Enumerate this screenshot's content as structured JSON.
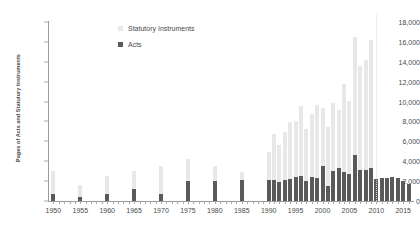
{
  "chart_data": {
    "type": "bar",
    "stacked": true,
    "title": "",
    "xlabel": "",
    "ylabel": "Pages of Acts and Statutory Instruments",
    "ylim": [
      0,
      18000
    ],
    "ytick_step": 2000,
    "ytick_labels": [
      "0",
      "2,000",
      "4,000",
      "6,000",
      "8,000",
      "10,000",
      "12,000",
      "14,000",
      "16,000",
      "18,000"
    ],
    "ytick_values": [
      0,
      2000,
      4000,
      6000,
      8000,
      10000,
      12000,
      14000,
      16000,
      18000
    ],
    "xlim": [
      1949,
      2017
    ],
    "xtick_labels": [
      "1950",
      "1955",
      "1960",
      "1965",
      "1970",
      "1975",
      "1980",
      "1985",
      "1990",
      "1995",
      "2000",
      "2005",
      "2010",
      "2015"
    ],
    "xtick_values": [
      1950,
      1955,
      1960,
      1965,
      1970,
      1975,
      1980,
      1985,
      1990,
      1995,
      2000,
      2005,
      2010,
      2015
    ],
    "grid": false,
    "legend_position": "top-center",
    "legend": [
      {
        "name": "Statutory Instruments",
        "color": "#e8e8e8"
      },
      {
        "name": "Acts",
        "color": "#5a5a5a"
      }
    ],
    "series": [
      {
        "name": "Acts",
        "color": "#5a5a5a"
      },
      {
        "name": "Statutory Instruments",
        "color": "#e8e8e8"
      }
    ],
    "annotations": [
      {
        "type": "vline",
        "x": 2010,
        "style": "dotted",
        "color": "#d8d8d8"
      }
    ],
    "points": [
      {
        "year": 1950,
        "acts": 700,
        "statutory_instruments": 3000
      },
      {
        "year": 1955,
        "acts": 450,
        "statutory_instruments": 1650
      },
      {
        "year": 1960,
        "acts": 750,
        "statutory_instruments": 2500
      },
      {
        "year": 1965,
        "acts": 1250,
        "statutory_instruments": 3000
      },
      {
        "year": 1970,
        "acts": 750,
        "statutory_instruments": 3500
      },
      {
        "year": 1975,
        "acts": 2000,
        "statutory_instruments": 4200
      },
      {
        "year": 1980,
        "acts": 2050,
        "statutory_instruments": 3500
      },
      {
        "year": 1985,
        "acts": 2100,
        "statutory_instruments": 2900
      },
      {
        "year": 1990,
        "acts": 2100,
        "statutory_instruments": 4900
      },
      {
        "year": 1991,
        "acts": 2150,
        "statutory_instruments": 6700
      },
      {
        "year": 1992,
        "acts": 1900,
        "statutory_instruments": 5600
      },
      {
        "year": 1993,
        "acts": 2150,
        "statutory_instruments": 6900
      },
      {
        "year": 1994,
        "acts": 2200,
        "statutory_instruments": 7900
      },
      {
        "year": 1995,
        "acts": 2400,
        "statutory_instruments": 8000
      },
      {
        "year": 1996,
        "acts": 2500,
        "statutory_instruments": 9600
      },
      {
        "year": 1997,
        "acts": 2000,
        "statutory_instruments": 7200
      },
      {
        "year": 1998,
        "acts": 2450,
        "statutory_instruments": 8700
      },
      {
        "year": 1999,
        "acts": 2350,
        "statutory_instruments": 9700
      },
      {
        "year": 2000,
        "acts": 3500,
        "statutory_instruments": 9400
      },
      {
        "year": 2001,
        "acts": 1550,
        "statutory_instruments": 7400
      },
      {
        "year": 2002,
        "acts": 3000,
        "statutory_instruments": 9900
      },
      {
        "year": 2003,
        "acts": 3350,
        "statutory_instruments": 9200
      },
      {
        "year": 2004,
        "acts": 2900,
        "statutory_instruments": 11800
      },
      {
        "year": 2005,
        "acts": 2700,
        "statutory_instruments": 10100
      },
      {
        "year": 2006,
        "acts": 4600,
        "statutory_instruments": 16500
      },
      {
        "year": 2007,
        "acts": 3100,
        "statutory_instruments": 13600
      },
      {
        "year": 2008,
        "acts": 3150,
        "statutory_instruments": 14200
      },
      {
        "year": 2009,
        "acts": 3300,
        "statutory_instruments": 16200
      },
      {
        "year": 2010,
        "acts": 2250,
        "statutory_instruments": 2250
      },
      {
        "year": 2011,
        "acts": 2300,
        "statutory_instruments": 2300
      },
      {
        "year": 2012,
        "acts": 2300,
        "statutory_instruments": 2300
      },
      {
        "year": 2013,
        "acts": 2450,
        "statutory_instruments": 2450
      },
      {
        "year": 2014,
        "acts": 2300,
        "statutory_instruments": 2300
      },
      {
        "year": 2015,
        "acts": 2050,
        "statutory_instruments": 2050
      },
      {
        "year": 2016,
        "acts": 1700,
        "statutory_instruments": 1700
      }
    ]
  }
}
